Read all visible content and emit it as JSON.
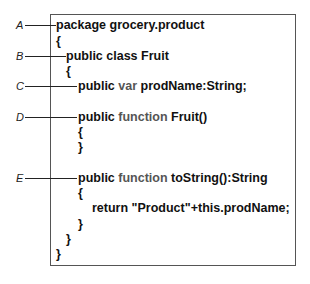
{
  "callouts": [
    {
      "label": "A",
      "y": 25,
      "line_end": 56
    },
    {
      "label": "B",
      "y": 56,
      "line_end": 66
    },
    {
      "label": "C",
      "y": 86,
      "line_end": 77
    },
    {
      "label": "D",
      "y": 117,
      "line_end": 77
    },
    {
      "label": "E",
      "y": 178,
      "line_end": 77
    }
  ],
  "code": {
    "lines": [
      {
        "indent": 56,
        "y": 25,
        "parts": [
          {
            "t": "package grocery.product"
          }
        ]
      },
      {
        "indent": 56,
        "y": 41,
        "parts": [
          {
            "t": "{"
          }
        ]
      },
      {
        "indent": 66,
        "y": 56,
        "parts": [
          {
            "t": "public class Fruit"
          }
        ]
      },
      {
        "indent": 66,
        "y": 71,
        "parts": [
          {
            "t": "{"
          }
        ]
      },
      {
        "indent": 78,
        "y": 86,
        "parts": [
          {
            "t": "public "
          },
          {
            "t": "var",
            "kw": true
          },
          {
            "t": " prodName:String;"
          }
        ]
      },
      {
        "indent": 78,
        "y": 117,
        "parts": [
          {
            "t": "public "
          },
          {
            "t": "function",
            "kw": true
          },
          {
            "t": " Fruit()"
          }
        ]
      },
      {
        "indent": 78,
        "y": 132,
        "parts": [
          {
            "t": "{"
          }
        ]
      },
      {
        "indent": 78,
        "y": 147,
        "parts": [
          {
            "t": "}"
          }
        ]
      },
      {
        "indent": 78,
        "y": 178,
        "parts": [
          {
            "t": "public "
          },
          {
            "t": "function",
            "kw": true
          },
          {
            "t": " toString():String"
          }
        ]
      },
      {
        "indent": 78,
        "y": 193,
        "parts": [
          {
            "t": "{"
          }
        ]
      },
      {
        "indent": 92,
        "y": 208,
        "parts": [
          {
            "t": "return \"Product\"+this.prodName;"
          }
        ]
      },
      {
        "indent": 78,
        "y": 224,
        "parts": [
          {
            "t": "}"
          }
        ]
      },
      {
        "indent": 66,
        "y": 239,
        "parts": [
          {
            "t": "}"
          }
        ]
      },
      {
        "indent": 56,
        "y": 254,
        "parts": [
          {
            "t": "}"
          }
        ]
      }
    ]
  },
  "colors": {
    "keyword": "#555555",
    "text": "#111111",
    "border": "#555555"
  }
}
